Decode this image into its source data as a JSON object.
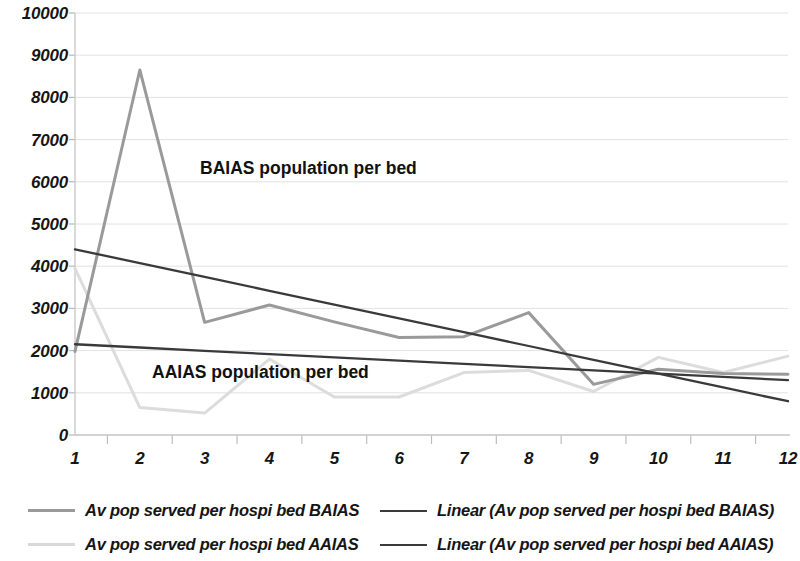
{
  "chart_data": {
    "type": "line",
    "title": "",
    "subtitle": "",
    "xlabel": "",
    "ylabel": "",
    "xlim": [
      1,
      12
    ],
    "ylim": [
      0,
      10000
    ],
    "grid": true,
    "grid_axis": "y",
    "legend_position": "bottom",
    "x": [
      1,
      2,
      3,
      4,
      5,
      6,
      7,
      8,
      9,
      10,
      11,
      12
    ],
    "x_tick_labels": [
      "1",
      "2",
      "3",
      "4",
      "5",
      "6",
      "7",
      "8",
      "9",
      "10",
      "11",
      "12"
    ],
    "y_ticks": [
      0,
      1000,
      2000,
      3000,
      4000,
      5000,
      6000,
      7000,
      8000,
      9000,
      10000
    ],
    "y_tick_labels": [
      "0",
      "1000",
      "2000",
      "3000",
      "4000",
      "5000",
      "6000",
      "7000",
      "8000",
      "9000",
      "10000"
    ],
    "series": [
      {
        "name": "Av pop served per hospi bed BAIAS",
        "kind": "line",
        "color": "#9a9a9a",
        "values": [
          1980,
          8650,
          2670,
          3080,
          2680,
          2310,
          2330,
          2900,
          1200,
          1560,
          1460,
          1440
        ]
      },
      {
        "name": "Av pop served per hospi bed AAIAS",
        "kind": "line",
        "color": "#dcdcdc",
        "values": [
          3950,
          650,
          520,
          1800,
          900,
          900,
          1480,
          1530,
          1030,
          1840,
          1480,
          1870
        ]
      },
      {
        "name": "Linear (Av pop served per hospi bed BAIAS)",
        "kind": "trendline",
        "color": "#3a3a3a",
        "values": [
          4400,
          4073,
          3745,
          3418,
          3091,
          2764,
          2436,
          2109,
          1782,
          1455,
          1127,
          800
        ]
      },
      {
        "name": "Linear (Av pop served per hospi bed AAIAS)",
        "kind": "trendline",
        "color": "#3a3a3a",
        "values": [
          2150,
          2073,
          1995,
          1918,
          1841,
          1764,
          1686,
          1609,
          1532,
          1455,
          1377,
          1300
        ]
      }
    ],
    "annotations": [
      {
        "id": "baias",
        "text": "BAIAS population per bed"
      },
      {
        "id": "aaias",
        "text": "AAIAS population per bed"
      }
    ]
  },
  "legend": {
    "rows": [
      {
        "left": {
          "label": "Av pop served per hospi bed BAIAS",
          "swatch": "series-baias"
        },
        "right": {
          "label": "Linear (Av pop served per hospi bed BAIAS)",
          "swatch": "trend-baias"
        }
      },
      {
        "left": {
          "label": "Av pop served per hospi bed AAIAS",
          "swatch": "series-aaias"
        },
        "right": {
          "label": "Linear (Av pop served per hospi bed AAIAS)",
          "swatch": "trend-aaias"
        }
      }
    ]
  },
  "colors": {
    "series_baias": "#9a9a9a",
    "series_aaias": "#dcdcdc",
    "trendline": "#3a3a3a",
    "gridline": "#e2e2e2",
    "axis": "#cccccc",
    "text": "#161616",
    "background": "#ffffff"
  }
}
